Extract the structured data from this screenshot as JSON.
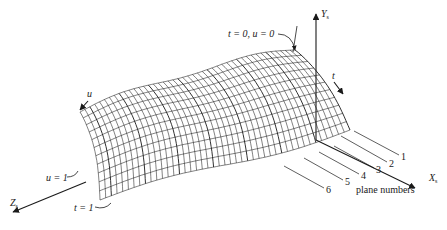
{
  "figure": {
    "type": "3d-wireframe-surface",
    "stroke_color": "#1a1a1a",
    "background": "#ffffff"
  },
  "axes": {
    "x": {
      "label": "X",
      "subscript": "s"
    },
    "y": {
      "label": "Y",
      "subscript": "s"
    },
    "z": {
      "label": "Z",
      "subscript": "s"
    }
  },
  "parameters": {
    "t_arrow_label": "t",
    "u_arrow_label": "u"
  },
  "annotations": {
    "origin_corner": "t = 0, u = 0",
    "u_end": "u = 1",
    "t_end": "t = 1",
    "plane_numbers_caption": "plane numbers"
  },
  "plane_numbers": [
    "1",
    "2",
    "3",
    "4",
    "5",
    "6"
  ]
}
